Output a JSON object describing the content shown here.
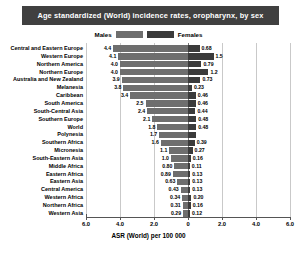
{
  "title": "Age standardized (World) incidence rates, oropharynx, by sex",
  "legend": {
    "male_label": "Males",
    "female_label": "Females",
    "male_color": "#6e6e6e",
    "female_color": "#3b3b3b"
  },
  "axis": {
    "x_title": "ASR (World) per 100 000",
    "ticks": [
      "6.0",
      "4.0",
      "2.0",
      "0",
      "2.0",
      "4.0",
      "6.0"
    ],
    "tick_values": [
      -6,
      -4,
      -2,
      0,
      2,
      4,
      6
    ]
  },
  "chart_data": {
    "type": "bar",
    "orientation": "horizontal",
    "subtype": "population-pyramid",
    "title": "Age standardized (World) incidence rates, oropharynx, by sex",
    "xlabel": "ASR (World) per 100 000",
    "ylabel": "",
    "xlim": [
      -6.4,
      6.4
    ],
    "xticks": [
      -6,
      -4,
      -2,
      0,
      2,
      4,
      6
    ],
    "xticklabels": [
      "6.0",
      "4.0",
      "2.0",
      "0",
      "2.0",
      "4.0",
      "6.0"
    ],
    "grid": true,
    "legend_position": "top-center",
    "categories": [
      "Central and Eastern Europe",
      "Western Europe",
      "Northern America",
      "Northern Europe",
      "Australia and New Zealand",
      "Melanesia",
      "Caribbean",
      "South America",
      "South-Central Asia",
      "Southern Europe",
      "World",
      "Polynesia",
      "Southern Africa",
      "Micronesia",
      "South-Eastern Asia",
      "Middle Africa",
      "Eastern Africa",
      "Eastern Asia",
      "Central America",
      "Western Africa",
      "Northern Africa",
      "Western Asia"
    ],
    "series": [
      {
        "name": "Males",
        "color": "#6e6e6e",
        "direction": "left",
        "values": [
          4.4,
          4.1,
          4.0,
          4.0,
          3.9,
          3.8,
          3.4,
          2.5,
          2.4,
          2.1,
          1.8,
          1.7,
          1.6,
          1.1,
          1.0,
          0.8,
          0.89,
          0.63,
          0.43,
          0.34,
          0.31,
          0.29
        ],
        "labels": [
          "4.4",
          "4.1",
          "4.0",
          "4.0",
          "3.9",
          "3.8",
          "3.4",
          "2.5",
          "2.4",
          "2.1",
          "1.8",
          "1.7",
          "1.6",
          "1.1",
          "1.0",
          "0.80",
          "0.89",
          "0.63",
          "0.43",
          "0.34",
          "0.31",
          "0.29"
        ]
      },
      {
        "name": "Females",
        "color": "#3b3b3b",
        "direction": "right",
        "values": [
          0.68,
          1.5,
          0.79,
          1.2,
          0.73,
          0.23,
          0.46,
          0.46,
          0.44,
          0.48,
          0.48,
          0.45,
          0.39,
          0.27,
          0.16,
          0.11,
          0.13,
          0.13,
          0.13,
          0.2,
          0.16,
          0.12
        ],
        "labels": [
          "0.68",
          "1.5",
          "0.79",
          "1.2",
          "0.73",
          "0.23",
          "0.46",
          "0.46",
          "0.44",
          "0.48",
          "0.48",
          "0.45",
          "0.39",
          "0.27",
          "0.16",
          "0.11",
          "0.13",
          "0.13",
          "0.13",
          "0.20",
          "0.16",
          "0.12"
        ]
      }
    ]
  }
}
